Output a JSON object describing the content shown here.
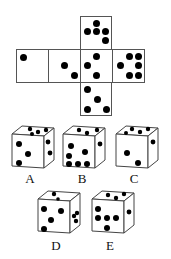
{
  "net": {
    "faces": [
      {
        "id": "top",
        "pips": 5
      },
      {
        "id": "row-1",
        "pips": 1
      },
      {
        "id": "row-2",
        "pips": 2
      },
      {
        "id": "row-3",
        "pips": 4
      },
      {
        "id": "row-4",
        "pips": 6
      },
      {
        "id": "bottom",
        "pips": 4
      }
    ]
  },
  "options": [
    {
      "label": "A"
    },
    {
      "label": "B"
    },
    {
      "label": "C"
    },
    {
      "label": "D"
    },
    {
      "label": "E"
    }
  ]
}
